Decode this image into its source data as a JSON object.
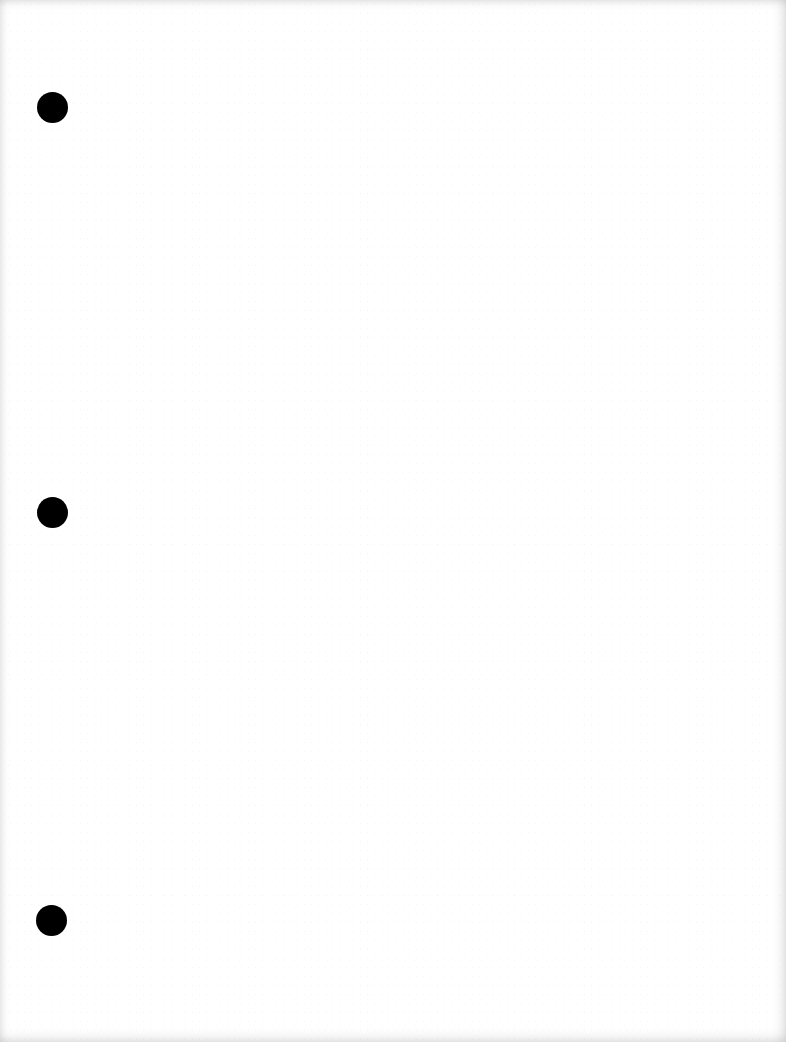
{
  "document": {
    "type": "blank scanned page",
    "text": "",
    "background_color": "#ffffff",
    "hole_punch_color": "#000000",
    "hole_punches": [
      {
        "label": "top",
        "cx": 52,
        "cy": 107,
        "diameter": 31
      },
      {
        "label": "middle",
        "cx": 52,
        "cy": 512,
        "diameter": 31
      },
      {
        "label": "bottom",
        "cx": 51,
        "cy": 920,
        "diameter": 31
      }
    ]
  }
}
